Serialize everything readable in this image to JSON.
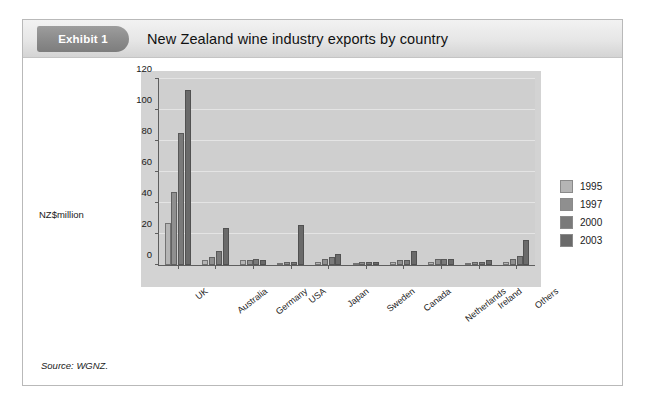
{
  "exhibit": {
    "tag": "Exhibit 1",
    "title": "New Zealand wine industry exports by country",
    "source": "Source: WGNZ."
  },
  "chart_data": {
    "type": "bar",
    "title": "New Zealand wine industry exports by country",
    "xlabel": "",
    "ylabel": "NZ$million",
    "ylim": [
      0,
      120
    ],
    "yticks": [
      0,
      20,
      40,
      60,
      80,
      100,
      120
    ],
    "grid": true,
    "legend_position": "right",
    "categories": [
      "UK",
      "Australia",
      "Germany",
      "USA",
      "Japan",
      "Sweden",
      "Canada",
      "Netherlands",
      "Ireland",
      "Others"
    ],
    "series": [
      {
        "name": "1995",
        "color": "#b5b5b5",
        "values": [
          27,
          3,
          3,
          1,
          2,
          1,
          2,
          2,
          1,
          2
        ]
      },
      {
        "name": "1997",
        "color": "#8f8f8f",
        "values": [
          47,
          5,
          3,
          2,
          4,
          2,
          3,
          4,
          2,
          4
        ]
      },
      {
        "name": "2000",
        "color": "#7a7a7a",
        "values": [
          85,
          9,
          4,
          2,
          5,
          2,
          3,
          4,
          2,
          6
        ]
      },
      {
        "name": "2003",
        "color": "#6a6a6a",
        "values": [
          113,
          24,
          3,
          26,
          7,
          2,
          9,
          4,
          3,
          16
        ]
      }
    ],
    "extra_series_note": null
  },
  "axis": {
    "y_title": "NZ$million"
  }
}
